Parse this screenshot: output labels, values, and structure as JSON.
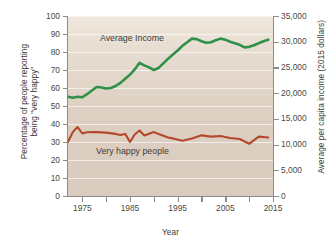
{
  "chart_data": {
    "type": "line",
    "title": "",
    "xlabel": "Year",
    "ylabel": "Percentage of people reporting\nbeing \"very happy\"",
    "ylabel_right": "Average per capita income (2015 dollars)",
    "xlim": [
      1972,
      2015
    ],
    "ylim": [
      0,
      100
    ],
    "ylim_right": [
      0,
      35000
    ],
    "xticks": [
      1975,
      1980,
      1985,
      1990,
      1995,
      2000,
      2005,
      2010,
      2015
    ],
    "xtick_labels": [
      "1975",
      "",
      "1985",
      "",
      "1995",
      "",
      "2005",
      "",
      "2015"
    ],
    "yticks_left": [
      0,
      10,
      20,
      30,
      40,
      50,
      60,
      70,
      80,
      90,
      100
    ],
    "ytick_labels_left": [
      "0",
      "10",
      "20",
      "30",
      "40",
      "50",
      "60",
      "70",
      "80",
      "90",
      "100"
    ],
    "yticks_right": [
      0,
      5000,
      10000,
      15000,
      20000,
      25000,
      30000,
      35000
    ],
    "ytick_labels_right": [
      "0",
      "5,000",
      "10,000",
      "15,000",
      "20,000",
      "25,000",
      "30,000",
      "35,000"
    ],
    "grid": true,
    "grid_color": "#ffffff",
    "plot_background": "#ddd0c2",
    "legend_position": "inline-annotations",
    "series": [
      {
        "name": "Average Income",
        "color": "#2e9049",
        "axis": "right",
        "units": "2015 dollars",
        "annotation": "Average Income",
        "x": [
          1972,
          1973,
          1974,
          1975,
          1976,
          1977,
          1978,
          1979,
          1980,
          1981,
          1982,
          1983,
          1984,
          1985,
          1986,
          1987,
          1988,
          1989,
          1990,
          1991,
          1992,
          1993,
          1994,
          1995,
          1996,
          1997,
          1998,
          1999,
          2000,
          2001,
          2002,
          2003,
          2004,
          2005,
          2006,
          2007,
          2008,
          2009,
          2010,
          2011,
          2012,
          2013,
          2014
        ],
        "values_right_axis": [
          19300,
          19100,
          19300,
          19200,
          19800,
          20500,
          21200,
          21100,
          20900,
          21000,
          21400,
          22000,
          22800,
          23600,
          24600,
          25900,
          25400,
          25000,
          24500,
          24900,
          25800,
          26700,
          27500,
          28300,
          29200,
          29900,
          30600,
          30500,
          30100,
          29800,
          29900,
          30300,
          30600,
          30400,
          30000,
          29700,
          29400,
          28900,
          29000,
          29300,
          29700,
          30100,
          30400
        ],
        "values_left_axis_equivalent": [
          55.1,
          54.6,
          55.1,
          54.9,
          56.6,
          58.6,
          60.6,
          60.3,
          59.7,
          60.0,
          61.1,
          62.9,
          65.1,
          67.4,
          70.3,
          74.0,
          72.6,
          71.4,
          70.0,
          71.1,
          73.7,
          76.3,
          78.6,
          80.9,
          83.4,
          85.4,
          87.4,
          87.1,
          86.0,
          85.1,
          85.4,
          86.6,
          87.4,
          86.9,
          85.7,
          84.9,
          84.0,
          82.6,
          82.9,
          83.7,
          84.9,
          86.0,
          86.9
        ]
      },
      {
        "name": "Very happy people",
        "color": "#b5472d",
        "axis": "left",
        "units": "percent",
        "annotation": "Very happy people",
        "x": [
          1972,
          1973,
          1974,
          1975,
          1976,
          1977,
          1978,
          1980,
          1982,
          1983,
          1984,
          1985,
          1986,
          1987,
          1988,
          1989,
          1990,
          1991,
          1993,
          1994,
          1996,
          1998,
          2000,
          2002,
          2004,
          2006,
          2008,
          2010,
          2012,
          2014
        ],
        "values": [
          30.0,
          35.5,
          38.3,
          34.8,
          35.4,
          35.5,
          35.5,
          35.2,
          34.5,
          33.9,
          34.5,
          30.0,
          34.2,
          36.4,
          33.6,
          34.6,
          35.5,
          34.4,
          32.5,
          32.0,
          30.7,
          32.0,
          33.7,
          33.0,
          33.3,
          32.2,
          31.7,
          29.0,
          33.0,
          32.5
        ]
      }
    ]
  },
  "axes": {
    "left_title": "Percentage of people reporting\nbeing \"very happy\"",
    "right_title": "Average per capita income (2015 dollars)",
    "bottom_title": "Year"
  }
}
